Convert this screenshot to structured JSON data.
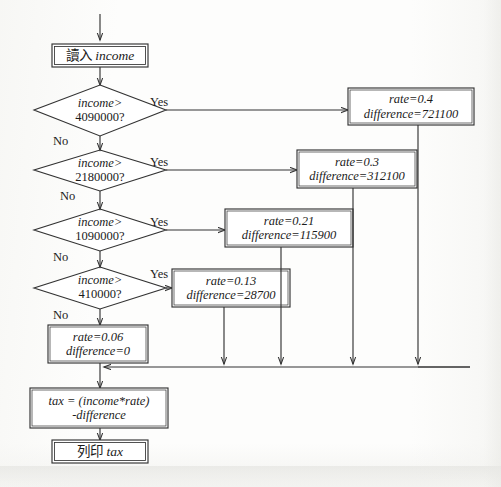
{
  "diagram": {
    "language": "zh-Hant",
    "colors": {
      "stroke": "#333333",
      "text": "#1b1b1b",
      "background": "#fdfdfc"
    },
    "nodes": {
      "input": {
        "kind": "process",
        "text": "讀入 income",
        "cjk": "讀入",
        "var": "income"
      },
      "decision1": {
        "kind": "decision",
        "line1": "income>",
        "line2": "4090000?",
        "yes_label": "Yes",
        "no_label": "No"
      },
      "decision2": {
        "kind": "decision",
        "line1": "income>",
        "line2": "2180000?",
        "yes_label": "Yes",
        "no_label": "No"
      },
      "decision3": {
        "kind": "decision",
        "line1": "income>",
        "line2": "1090000?",
        "yes_label": "Yes",
        "no_label": "No"
      },
      "decision4": {
        "kind": "decision",
        "line1": "income>",
        "line2": "410000?",
        "yes_label": "Yes",
        "no_label": "No"
      },
      "assign1": {
        "kind": "process",
        "rate": "rate=0.4",
        "difference": "difference=721100"
      },
      "assign2": {
        "kind": "process",
        "rate": "rate=0.3",
        "difference": "difference=312100"
      },
      "assign3": {
        "kind": "process",
        "rate": "rate=0.21",
        "difference": "difference=115900"
      },
      "assign4": {
        "kind": "process",
        "rate": "rate=0.13",
        "difference": "difference=28700"
      },
      "assign5": {
        "kind": "process",
        "rate": "rate=0.06",
        "difference": "difference=0"
      },
      "compute": {
        "kind": "process",
        "line1": "tax = (income*rate)",
        "line2": "-difference"
      },
      "output": {
        "kind": "process",
        "text": "列印 tax",
        "cjk": "列印",
        "var": "tax"
      }
    },
    "tax_brackets": [
      {
        "condition": "income>4090000?",
        "rate": 0.4,
        "difference": 721100
      },
      {
        "condition": "income>2180000?",
        "rate": 0.3,
        "difference": 312100
      },
      {
        "condition": "income>1090000?",
        "rate": 0.21,
        "difference": 115900
      },
      {
        "condition": "income>410000?",
        "rate": 0.13,
        "difference": 28700
      },
      {
        "condition": "else",
        "rate": 0.06,
        "difference": 0
      }
    ],
    "formula": "tax = (income*rate) - difference"
  }
}
